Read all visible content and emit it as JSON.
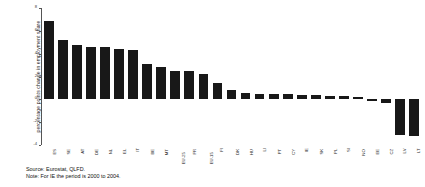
{
  "footer": {
    "source": "Source: Eurostat, QLFD.",
    "note": "Note: For IE the period is 2000 to 2004."
  },
  "chart_data": {
    "type": "bar",
    "title": "",
    "subtitle": "",
    "xlabel": "",
    "ylabel": "percentage points change in employment share",
    "ylim": [
      -4,
      8
    ],
    "yticks": [
      8,
      6,
      4,
      2,
      0,
      -2,
      -4
    ],
    "ytick_labels": [
      "8",
      "6",
      "4",
      "2",
      "0",
      "-2",
      "-4"
    ],
    "grid": false,
    "legend": "none",
    "bar_color": "#181818",
    "categories": [
      "ES",
      "SE",
      "AT",
      "DE",
      "NL",
      "EL",
      "IT",
      "BE",
      "MT",
      "EU-25",
      "FR",
      "EU-15",
      "FI",
      "DK",
      "HU",
      "LI",
      "PT",
      "CY",
      "IE",
      "SK",
      "PL",
      "SI",
      "NO",
      "EE",
      "CZ",
      "LV",
      "LT"
    ],
    "values": [
      6.9,
      5.2,
      4.8,
      4.6,
      4.6,
      4.45,
      4.35,
      3.1,
      2.8,
      2.5,
      2.5,
      2.2,
      1.45,
      0.8,
      0.55,
      0.5,
      0.5,
      0.45,
      0.42,
      0.35,
      0.3,
      0.3,
      0.22,
      -0.15,
      -0.35,
      -3.15,
      -3.2
    ]
  }
}
